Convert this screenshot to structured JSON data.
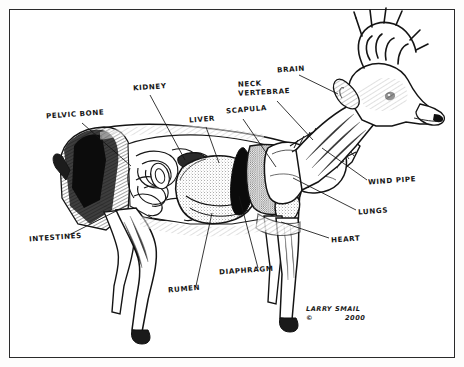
{
  "figure": {
    "kind": "anatomical-illustration",
    "border_color": "#2a2a2a",
    "ink_color": "#151515",
    "paper_color": "#ffffff"
  },
  "labels": [
    {
      "id": "pelvic-bone",
      "text": "PELVIC BONE",
      "x": 46,
      "y": 116,
      "rot": -4
    },
    {
      "id": "kidney",
      "text": "KIDNEY",
      "x": 133,
      "y": 88,
      "rot": -4
    },
    {
      "id": "liver",
      "text": "LIVER",
      "x": 189,
      "y": 120,
      "rot": -4
    },
    {
      "id": "scapula",
      "text": "SCAPULA",
      "x": 226,
      "y": 111,
      "rot": -5
    },
    {
      "id": "neck-vertebrae",
      "text": "NECK\nVERTEBRAE",
      "x": 238,
      "y": 89,
      "rot": -3
    },
    {
      "id": "brain",
      "text": "BRAIN",
      "x": 277,
      "y": 70,
      "rot": -4
    },
    {
      "id": "windpipe",
      "text": "WIND PIPE",
      "x": 368,
      "y": 182,
      "rot": -4
    },
    {
      "id": "lungs",
      "text": "LUNGS",
      "x": 358,
      "y": 212,
      "rot": -4
    },
    {
      "id": "heart",
      "text": "HEART",
      "x": 331,
      "y": 240,
      "rot": -4
    },
    {
      "id": "diaphragm",
      "text": "DIAPHRAGM",
      "x": 219,
      "y": 272,
      "rot": -4
    },
    {
      "id": "rumen",
      "text": "RUMEN",
      "x": 168,
      "y": 290,
      "rot": -5
    },
    {
      "id": "intestines",
      "text": "INTESTINES",
      "x": 29,
      "y": 239,
      "rot": -4
    }
  ],
  "signature": {
    "artist": "LARRY SMAIL",
    "year": "2000",
    "copyright_mark": "©",
    "artist_pos": {
      "x": 306,
      "y": 305
    },
    "year_pos": {
      "x": 345,
      "y": 314
    },
    "mark_pos": {
      "x": 306,
      "y": 314
    }
  },
  "leader_lines": [
    {
      "id": "pelvic-bone-leader",
      "from": [
        82,
        123
      ],
      "to": [
        131,
        166
      ]
    },
    {
      "id": "kidney-leader",
      "from": [
        150,
        95
      ],
      "to": [
        185,
        160
      ]
    },
    {
      "id": "liver-leader",
      "from": [
        206,
        127
      ],
      "to": [
        219,
        163
      ]
    },
    {
      "id": "scapula-leader",
      "from": [
        243,
        119
      ],
      "to": [
        276,
        167
      ]
    },
    {
      "id": "neck-vertebrae-leader",
      "from": [
        277,
        101
      ],
      "to": [
        313,
        140
      ]
    },
    {
      "id": "brain-leader",
      "from": [
        299,
        75
      ],
      "to": [
        338,
        94
      ]
    },
    {
      "id": "windpipe-leader",
      "from": [
        367,
        180
      ],
      "to": [
        322,
        148
      ]
    },
    {
      "id": "lungs-leader",
      "from": [
        356,
        210
      ],
      "to": [
        293,
        178
      ]
    },
    {
      "id": "heart-leader",
      "from": [
        329,
        238
      ],
      "to": [
        281,
        222
      ]
    },
    {
      "id": "diaphragm-leader",
      "from": [
        258,
        268
      ],
      "to": [
        239,
        196
      ]
    },
    {
      "id": "rumen-leader",
      "from": [
        196,
        286
      ],
      "to": [
        212,
        213
      ]
    },
    {
      "id": "intestines-leader",
      "from": [
        69,
        235
      ],
      "to": [
        128,
        205
      ]
    }
  ]
}
